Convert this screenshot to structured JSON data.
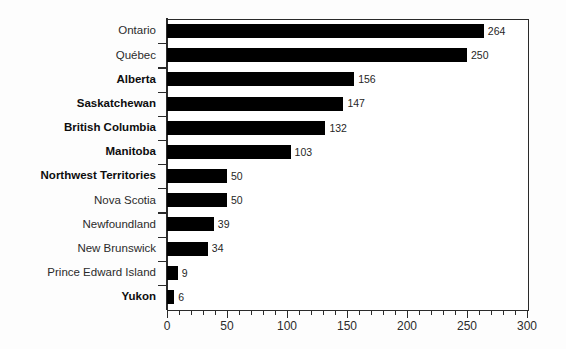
{
  "chart_data": {
    "type": "bar",
    "orientation": "horizontal",
    "title": "",
    "xlabel": "",
    "ylabel": "",
    "xlim": [
      0,
      300
    ],
    "xticks": [
      0,
      50,
      100,
      150,
      200,
      250,
      300
    ],
    "xtick_labels": [
      "0",
      "50",
      "100",
      "150",
      "200",
      "250",
      "300"
    ],
    "minor_tick_interval": 10,
    "grid": false,
    "legend": false,
    "bar_color": "#000000",
    "categories": [
      "Ontario",
      "Québec",
      "Alberta",
      "Saskatchewan",
      "British Columbia",
      "Manitoba",
      "Northwest Territories",
      "Nova Scotia",
      "Newfoundland",
      "New Brunswick",
      "Prince Edward Island",
      "Yukon"
    ],
    "values": [
      264,
      250,
      156,
      147,
      132,
      103,
      50,
      50,
      39,
      34,
      9,
      6
    ],
    "value_labels": [
      "264",
      "250",
      "156",
      "147",
      "132",
      "103",
      "50",
      "50",
      "39",
      "34",
      "9",
      "6"
    ],
    "category_emphasis": [
      "regular",
      "regular",
      "bold",
      "bold",
      "bold",
      "bold",
      "bold",
      "regular",
      "regular",
      "regular",
      "regular",
      "bold"
    ]
  }
}
